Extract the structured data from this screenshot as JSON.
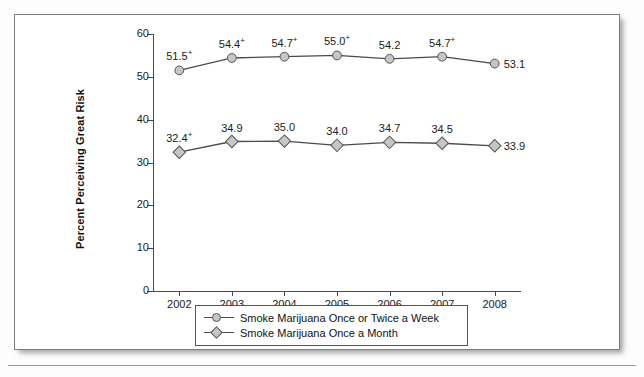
{
  "chart_data": {
    "type": "line",
    "title": "",
    "xlabel": "",
    "ylabel": "Percent Perceiving Great Risk",
    "categories": [
      "2002",
      "2003",
      "2004",
      "2005",
      "2006",
      "2007",
      "2008"
    ],
    "ylim": [
      0,
      60
    ],
    "yticks": [
      "0",
      "10",
      "20",
      "30",
      "40",
      "50",
      "60"
    ],
    "grid": false,
    "legend_position": "bottom",
    "series": [
      {
        "name": "Smoke Marijuana Once or Twice a Week",
        "marker": "circle",
        "values": [
          51.5,
          54.4,
          54.7,
          55.0,
          54.2,
          54.7,
          53.1
        ],
        "labels": [
          {
            "text": "51.5",
            "sup": "+"
          },
          {
            "text": "54.4",
            "sup": "+"
          },
          {
            "text": "54.7",
            "sup": "+"
          },
          {
            "text": "55.0",
            "sup": "+"
          },
          {
            "text": "54.2",
            "sup": ""
          },
          {
            "text": "54.7",
            "sup": "+"
          },
          {
            "text": "53.1",
            "sup": ""
          }
        ]
      },
      {
        "name": "Smoke Marijuana Once a Month",
        "marker": "diamond",
        "values": [
          32.4,
          34.9,
          35.0,
          34.0,
          34.7,
          34.5,
          33.9
        ],
        "labels": [
          {
            "text": "32.4",
            "sup": "+"
          },
          {
            "text": "34.9",
            "sup": ""
          },
          {
            "text": "35.0",
            "sup": ""
          },
          {
            "text": "34.0",
            "sup": ""
          },
          {
            "text": "34.7",
            "sup": ""
          },
          {
            "text": "34.5",
            "sup": ""
          },
          {
            "text": "33.9",
            "sup": ""
          }
        ]
      }
    ],
    "colors": {
      "line": "#4a4a4a",
      "marker_fill": "#c6c6c6",
      "marker_stroke": "#555555",
      "text": "#111111",
      "panel_border": "#7d7d7d"
    }
  },
  "legend": {
    "items": [
      {
        "label": "Smoke Marijuana Once or Twice a Week",
        "marker": "circle"
      },
      {
        "label": "Smoke Marijuana Once a Month",
        "marker": "diamond"
      }
    ]
  }
}
